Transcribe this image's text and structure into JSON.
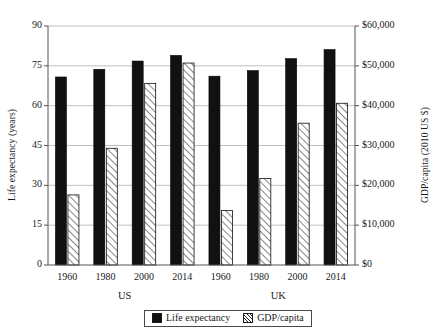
{
  "chart_data": {
    "type": "bar",
    "title": "",
    "subtitle": "",
    "categories": [
      "1960",
      "1980",
      "2000",
      "2014",
      "1960",
      "1980",
      "2000",
      "2014"
    ],
    "groups": [
      {
        "name": "US",
        "categories": [
          "1960",
          "1980",
          "2000",
          "2014"
        ]
      },
      {
        "name": "UK",
        "categories": [
          "1960",
          "1980",
          "2000",
          "2014"
        ]
      }
    ],
    "series": [
      {
        "name": "Life expectancy",
        "axis": "left",
        "style": "solid-black",
        "values": [
          70.8,
          73.7,
          76.8,
          78.9,
          71.1,
          73.2,
          77.7,
          81.1
        ]
      },
      {
        "name": "GDP/capita",
        "axis": "right",
        "style": "white-hatched",
        "values": [
          17600,
          29300,
          45600,
          50700,
          13700,
          21700,
          35600,
          40600
        ]
      }
    ],
    "xlabel": "",
    "ylabel": "Life expectancy (years)",
    "y2label": "GDP/capita (2010 US $)",
    "ylim": [
      0,
      90
    ],
    "y2lim": [
      0,
      60000
    ],
    "yticks": [
      "0",
      "15",
      "30",
      "45",
      "60",
      "75",
      "90"
    ],
    "ytick_values": [
      0,
      15,
      30,
      45,
      60,
      75,
      90
    ],
    "y2ticks": [
      "$0",
      "$10,000",
      "$20,000",
      "$30,000",
      "$40,000",
      "$50,000",
      "$60,000"
    ],
    "y2tick_values": [
      0,
      10000,
      20000,
      30000,
      40000,
      50000,
      60000
    ],
    "grid": true,
    "legend": {
      "position": "bottom-center",
      "entries": [
        {
          "label": "Life expectancy",
          "swatch": "solid-black-swatch"
        },
        {
          "label": "GDP/capita",
          "swatch": "hatched-white-swatch"
        }
      ]
    },
    "colors": {
      "life_expectancy_bar": "#111111",
      "gdp_bar_fill": "#ffffff",
      "gdp_bar_hatch": "#222222",
      "axis": "#555555",
      "gridline": "#b0b0b0",
      "text": "#1a1a1a"
    }
  }
}
